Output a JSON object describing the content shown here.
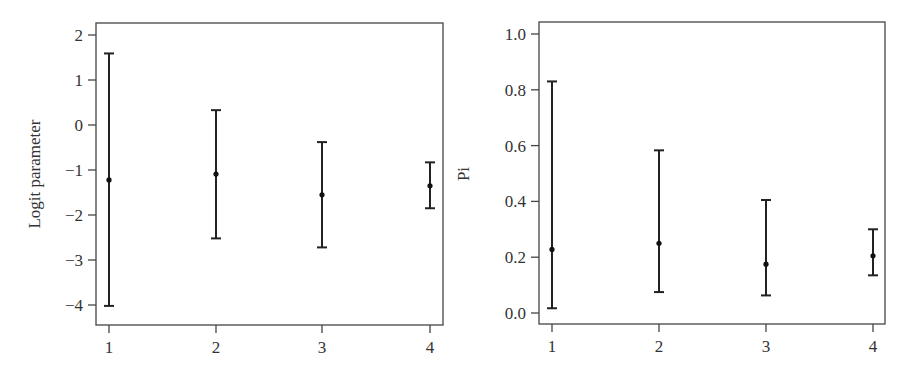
{
  "chart_data": [
    {
      "type": "errorbar",
      "title": "",
      "xlabel": "",
      "ylabel": "Logit parameter",
      "categories": [
        "1",
        "2",
        "3",
        "4"
      ],
      "x": [
        1,
        2,
        3,
        4
      ],
      "yticks": [
        2,
        1,
        0,
        -1,
        -2,
        -3,
        -4
      ],
      "ytick_labels": [
        "2",
        "1",
        "0",
        "−1",
        "−2",
        "−3",
        "−4"
      ],
      "ylim": [
        -4.45,
        2.25
      ],
      "grid": false,
      "legend": null,
      "series": [
        {
          "name": "estimate",
          "values": [
            -1.22,
            -1.09,
            -1.55,
            -1.35
          ],
          "lower": [
            -4.02,
            -2.52,
            -2.72,
            -1.85
          ],
          "upper": [
            1.59,
            0.33,
            -0.38,
            -0.83
          ]
        }
      ]
    },
    {
      "type": "errorbar",
      "title": "",
      "xlabel": "",
      "ylabel": "Pi",
      "categories": [
        "1",
        "2",
        "3",
        "4"
      ],
      "x": [
        1,
        2,
        3,
        4
      ],
      "yticks": [
        1.0,
        0.8,
        0.6,
        0.4,
        0.2,
        0.0
      ],
      "ytick_labels": [
        "1.0",
        "0.8",
        "0.6",
        "0.4",
        "0.2",
        "0.0"
      ],
      "ylim": [
        -0.04,
        1.04
      ],
      "grid": false,
      "legend": null,
      "series": [
        {
          "name": "estimate",
          "values": [
            0.228,
            0.25,
            0.175,
            0.205
          ],
          "lower": [
            0.017,
            0.075,
            0.063,
            0.135
          ],
          "upper": [
            0.83,
            0.583,
            0.405,
            0.3
          ]
        }
      ]
    }
  ],
  "panels": {
    "left": {
      "ylabel": "Logit parameter"
    },
    "right": {
      "ylabel": "Pi"
    }
  },
  "colors": {
    "frame": "#444444",
    "bars": "#222222",
    "text": "#333333",
    "background": "#ffffff"
  }
}
